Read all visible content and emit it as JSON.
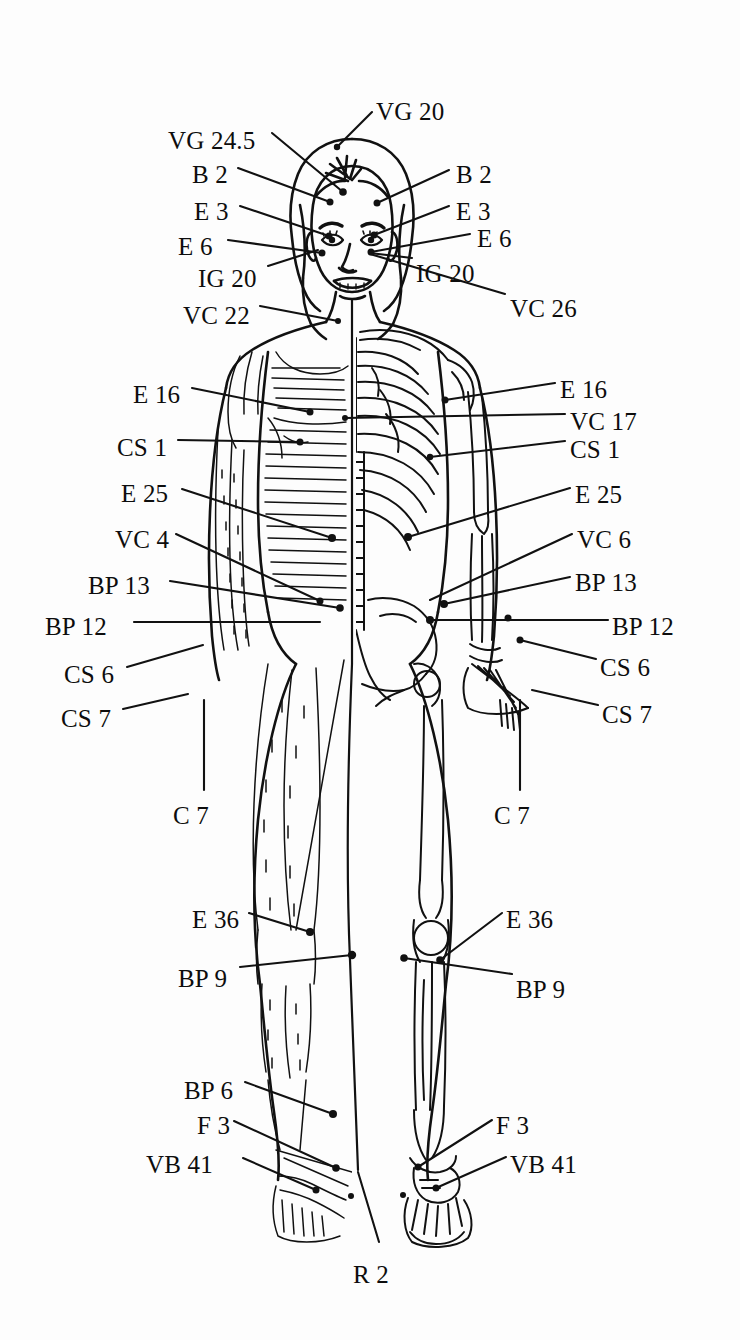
{
  "figure": {
    "type": "anatomical-line-drawing",
    "background_color": "#fdfdfd",
    "ink_color": "#111111"
  },
  "labels": {
    "head": [
      {
        "id": "vg20",
        "text": "VG 20",
        "x": 376,
        "y": 99,
        "align": "left",
        "line": [
          [
            372,
            112
          ],
          [
            337,
            147
          ]
        ]
      },
      {
        "id": "vg24_5",
        "text": "VG 24.5",
        "x": 168,
        "y": 128,
        "align": "left",
        "line": [
          [
            272,
            133
          ],
          [
            343,
            192
          ]
        ]
      },
      {
        "id": "b2-left",
        "text": "B 2",
        "x": 192,
        "y": 162,
        "align": "left",
        "line": [
          [
            238,
            168
          ],
          [
            330,
            202
          ]
        ]
      },
      {
        "id": "b2-right",
        "text": "B 2",
        "x": 456,
        "y": 162,
        "align": "left",
        "line": [
          [
            449,
            170
          ],
          [
            377,
            203
          ]
        ]
      },
      {
        "id": "e3-left",
        "text": "E 3",
        "x": 194,
        "y": 199,
        "align": "left",
        "line": [
          [
            240,
            206
          ],
          [
            329,
            236
          ]
        ]
      },
      {
        "id": "e3-right",
        "text": "E 3",
        "x": 456,
        "y": 199,
        "align": "left",
        "line": [
          [
            449,
            206
          ],
          [
            374,
            235
          ]
        ]
      },
      {
        "id": "e6-left",
        "text": "E 6",
        "x": 178,
        "y": 234,
        "align": "left",
        "line": [
          [
            228,
            240
          ],
          [
            322,
            253
          ]
        ]
      },
      {
        "id": "e6-right",
        "text": "E 6",
        "x": 477,
        "y": 226,
        "align": "left",
        "line": [
          [
            470,
            234
          ],
          [
            371,
            252
          ]
        ]
      },
      {
        "id": "ig20-left",
        "text": "IG 20",
        "x": 198,
        "y": 266,
        "align": "left",
        "line": [
          [
            268,
            266
          ],
          [
            318,
            250
          ]
        ]
      },
      {
        "id": "ig20-right",
        "text": "IG 20",
        "x": 416,
        "y": 261,
        "align": "left",
        "line": [
          [
            412,
            258
          ],
          [
            370,
            253
          ]
        ]
      }
    ],
    "torso": [
      {
        "id": "vc22",
        "text": "VC 22",
        "x": 183,
        "y": 303,
        "align": "left",
        "line": [
          [
            260,
            306
          ],
          [
            338,
            321
          ]
        ]
      },
      {
        "id": "vc26",
        "text": "VC 26",
        "x": 510,
        "y": 296,
        "align": "left",
        "line": [
          [
            505,
            294
          ],
          [
            370,
            254
          ]
        ]
      },
      {
        "id": "e16-left",
        "text": "E 16",
        "x": 133,
        "y": 382,
        "align": "left",
        "line": [
          [
            192,
            388
          ],
          [
            310,
            412
          ]
        ]
      },
      {
        "id": "e16-right",
        "text": "E 16",
        "x": 560,
        "y": 377,
        "align": "left",
        "line": [
          [
            555,
            383
          ],
          [
            445,
            400
          ]
        ]
      },
      {
        "id": "vc17",
        "text": "VC 17",
        "x": 570,
        "y": 409,
        "align": "left",
        "line": [
          [
            565,
            414
          ],
          [
            345,
            418
          ]
        ]
      },
      {
        "id": "cs1-left",
        "text": "CS 1",
        "x": 117,
        "y": 435,
        "align": "left",
        "line": [
          [
            178,
            440
          ],
          [
            300,
            442
          ]
        ]
      },
      {
        "id": "cs1-right",
        "text": "CS 1",
        "x": 570,
        "y": 437,
        "align": "left",
        "line": [
          [
            565,
            441
          ],
          [
            430,
            457
          ]
        ]
      },
      {
        "id": "e25-left",
        "text": "E 25",
        "x": 121,
        "y": 481,
        "align": "left",
        "line": [
          [
            182,
            489
          ],
          [
            332,
            538
          ]
        ]
      },
      {
        "id": "e25-right",
        "text": "E 25",
        "x": 575,
        "y": 482,
        "align": "left",
        "line": [
          [
            570,
            488
          ],
          [
            408,
            537
          ]
        ]
      },
      {
        "id": "vc4",
        "text": "VC 4",
        "x": 115,
        "y": 527,
        "align": "left",
        "line": [
          [
            176,
            534
          ],
          [
            320,
            601
          ]
        ]
      },
      {
        "id": "vc6",
        "text": "VC 6",
        "x": 577,
        "y": 527,
        "align": "left",
        "line": [
          [
            572,
            534
          ],
          [
            430,
            600
          ]
        ]
      },
      {
        "id": "bp13-left",
        "text": "BP 13",
        "x": 88,
        "y": 573,
        "align": "left",
        "line": [
          [
            170,
            581
          ],
          [
            340,
            608
          ]
        ]
      },
      {
        "id": "bp13-right",
        "text": "BP 13",
        "x": 575,
        "y": 570,
        "align": "left",
        "line": [
          [
            570,
            577
          ],
          [
            444,
            604
          ]
        ]
      },
      {
        "id": "bp12-left",
        "text": "BP 12",
        "x": 45,
        "y": 614,
        "align": "left",
        "line": [
          [
            134,
            622
          ],
          [
            320,
            622
          ]
        ]
      },
      {
        "id": "bp12-right",
        "text": "BP 12",
        "x": 612,
        "y": 614,
        "align": "left",
        "line": [
          [
            608,
            620
          ],
          [
            430,
            620
          ]
        ]
      },
      {
        "id": "cs6-left",
        "text": "CS 6",
        "x": 64,
        "y": 662,
        "align": "left",
        "line": [
          [
            127,
            667
          ],
          [
            203,
            645
          ]
        ]
      },
      {
        "id": "cs6-right",
        "text": "CS 6",
        "x": 600,
        "y": 655,
        "align": "left",
        "line": [
          [
            596,
            659
          ],
          [
            520,
            640
          ]
        ]
      },
      {
        "id": "cs7-left",
        "text": "CS 7",
        "x": 61,
        "y": 706,
        "align": "left",
        "line": [
          [
            123,
            709
          ],
          [
            188,
            694
          ]
        ]
      },
      {
        "id": "cs7-right",
        "text": "CS 7",
        "x": 602,
        "y": 702,
        "align": "left",
        "line": [
          [
            598,
            705
          ],
          [
            532,
            690
          ]
        ]
      },
      {
        "id": "c7-left",
        "text": "C 7",
        "x": 173,
        "y": 803,
        "align": "left",
        "line": [
          [
            204,
            790
          ],
          [
            204,
            700
          ]
        ]
      },
      {
        "id": "c7-right",
        "text": "C 7",
        "x": 494,
        "y": 803,
        "align": "left",
        "line": [
          [
            520,
            790
          ],
          [
            520,
            700
          ]
        ]
      }
    ],
    "legs": [
      {
        "id": "e36-left",
        "text": "E 36",
        "x": 192,
        "y": 907,
        "align": "left",
        "line": [
          [
            249,
            913
          ],
          [
            310,
            932
          ]
        ]
      },
      {
        "id": "e36-right",
        "text": "E 36",
        "x": 506,
        "y": 907,
        "align": "left",
        "line": [
          [
            502,
            913
          ],
          [
            440,
            960
          ]
        ]
      },
      {
        "id": "bp9-left",
        "text": "BP 9",
        "x": 178,
        "y": 966,
        "align": "left",
        "line": [
          [
            240,
            967
          ],
          [
            352,
            955
          ]
        ]
      },
      {
        "id": "bp9-right",
        "text": "BP 9",
        "x": 516,
        "y": 977,
        "align": "left",
        "line": [
          [
            512,
            974
          ],
          [
            404,
            958
          ]
        ]
      },
      {
        "id": "bp6",
        "text": "BP 6",
        "x": 184,
        "y": 1078,
        "align": "left",
        "line": [
          [
            245,
            1082
          ],
          [
            333,
            1114
          ]
        ]
      },
      {
        "id": "f3-left",
        "text": "F 3",
        "x": 197,
        "y": 1113,
        "align": "left",
        "line": [
          [
            234,
            1121
          ],
          [
            336,
            1168
          ]
        ]
      },
      {
        "id": "f3-right",
        "text": "F 3",
        "x": 496,
        "y": 1113,
        "align": "left",
        "line": [
          [
            492,
            1120
          ],
          [
            418,
            1167
          ]
        ]
      },
      {
        "id": "vb41-left",
        "text": "VB 41",
        "x": 146,
        "y": 1152,
        "align": "left",
        "line": [
          [
            243,
            1158
          ],
          [
            316,
            1190
          ]
        ]
      },
      {
        "id": "vb41-right",
        "text": "VB 41",
        "x": 510,
        "y": 1152,
        "align": "left",
        "line": [
          [
            506,
            1157
          ],
          [
            436,
            1188
          ]
        ]
      },
      {
        "id": "r2",
        "text": "R 2",
        "x": 371,
        "y": 1262,
        "align": "center",
        "line": [
          [
            358,
            1172
          ],
          [
            379,
            1242
          ]
        ]
      }
    ]
  },
  "acupoints": [
    {
      "id": "p-vg20",
      "x": 337,
      "y": 147,
      "r": 3.2
    },
    {
      "id": "p-vg24_5",
      "x": 343,
      "y": 192,
      "r": 3.8
    },
    {
      "id": "p-b2-l",
      "x": 330,
      "y": 202,
      "r": 3.5
    },
    {
      "id": "p-b2-r",
      "x": 377,
      "y": 203,
      "r": 3.5
    },
    {
      "id": "p-e3-l",
      "x": 329,
      "y": 236,
      "r": 3.5
    },
    {
      "id": "p-e3-r",
      "x": 374,
      "y": 235,
      "r": 3.5
    },
    {
      "id": "p-e6-l",
      "x": 322,
      "y": 253,
      "r": 3.5
    },
    {
      "id": "p-e6-r",
      "x": 371,
      "y": 252,
      "r": 3.5
    },
    {
      "id": "p-vc22",
      "x": 338,
      "y": 321,
      "r": 3.0
    },
    {
      "id": "p-e16-l",
      "x": 310,
      "y": 412,
      "r": 3.5
    },
    {
      "id": "p-e16-r",
      "x": 445,
      "y": 400,
      "r": 3.5
    },
    {
      "id": "p-vc17",
      "x": 345,
      "y": 418,
      "r": 3.0
    },
    {
      "id": "p-cs1-l",
      "x": 300,
      "y": 442,
      "r": 3.5
    },
    {
      "id": "p-cs1-r",
      "x": 430,
      "y": 457,
      "r": 3.2
    },
    {
      "id": "p-e25-l",
      "x": 332,
      "y": 538,
      "r": 4.0
    },
    {
      "id": "p-e25-r",
      "x": 408,
      "y": 537,
      "r": 4.0
    },
    {
      "id": "p-vc4",
      "x": 320,
      "y": 601,
      "r": 3.5
    },
    {
      "id": "p-bp13-l",
      "x": 340,
      "y": 608,
      "r": 3.8
    },
    {
      "id": "p-bp13-r",
      "x": 444,
      "y": 604,
      "r": 4.0
    },
    {
      "id": "p-bp12-r",
      "x": 430,
      "y": 620,
      "r": 4.0
    },
    {
      "id": "p-bp12-l2",
      "x": 508,
      "y": 618,
      "r": 3.5
    },
    {
      "id": "p-cs6-r",
      "x": 520,
      "y": 640,
      "r": 3.5
    },
    {
      "id": "p-e36-l",
      "x": 310,
      "y": 932,
      "r": 4.0
    },
    {
      "id": "p-bp9-l",
      "x": 352,
      "y": 955,
      "r": 4.2
    },
    {
      "id": "p-bp9-r",
      "x": 404,
      "y": 958,
      "r": 3.8
    },
    {
      "id": "p-e36-r",
      "x": 440,
      "y": 960,
      "r": 3.8
    },
    {
      "id": "p-bp6",
      "x": 333,
      "y": 1114,
      "r": 4.0
    },
    {
      "id": "p-f3-l",
      "x": 336,
      "y": 1168,
      "r": 3.8
    },
    {
      "id": "p-f3-r",
      "x": 418,
      "y": 1167,
      "r": 3.5
    },
    {
      "id": "p-vb41-l",
      "x": 316,
      "y": 1190,
      "r": 3.5
    },
    {
      "id": "p-vb41-r",
      "x": 436,
      "y": 1188,
      "r": 3.5
    },
    {
      "id": "p-r2-l",
      "x": 351,
      "y": 1196,
      "r": 3.0
    },
    {
      "id": "p-r2-r",
      "x": 403,
      "y": 1195,
      "r": 3.0
    }
  ]
}
